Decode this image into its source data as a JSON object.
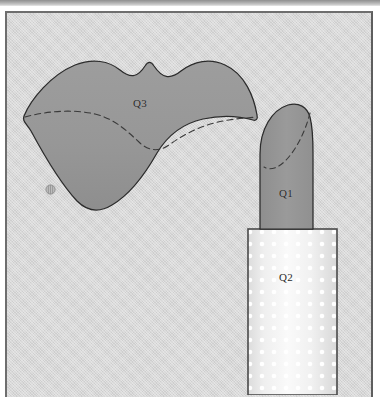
{
  "figure": {
    "kind": "patent-line-drawing",
    "background_color": "#d5d5d5",
    "shaded_fill_color": "#969696",
    "outline_color": "#2b2b2b",
    "tube_fill_light": "#f2f2f2",
    "tube_dot_color": "#ffffff",
    "page_bar_color": "#a8a8a8"
  },
  "labels": {
    "lips": "Q3",
    "bullet_tip": "Q1",
    "tube_body": "Q2"
  },
  "markers": {
    "hatch_circle": "hatched-circle-marker"
  },
  "shapes": {
    "lips": {
      "name": "lips-outline",
      "fill": "#969696",
      "stroke": "#2b2b2b",
      "has_dashed_inner_line": true
    },
    "bullet": {
      "name": "lipstick-bullet-tip",
      "fill": "#969696",
      "stroke": "#2b2b2b",
      "has_dashed_arc": true
    },
    "tube": {
      "name": "lipstick-tube-body",
      "fill": "#f2f2f2",
      "stroke": "#4a4a4a",
      "pattern": "white-polka-dot-grid"
    }
  }
}
